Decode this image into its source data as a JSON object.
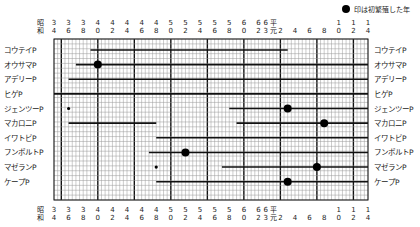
{
  "caption": "",
  "legend": {
    "marker": "●",
    "text": "印は初繁殖した年"
  },
  "axis": {
    "era_label_top": "昭",
    "era_label_bottom": "和",
    "ticks": [
      {
        "top": "3",
        "bottom": "4",
        "year": 1959
      },
      {
        "top": "3",
        "bottom": "6",
        "year": 1961
      },
      {
        "top": "3",
        "bottom": "8",
        "year": 1963
      },
      {
        "top": "4",
        "bottom": "0",
        "year": 1965
      },
      {
        "top": "4",
        "bottom": "2",
        "year": 1967
      },
      {
        "top": "4",
        "bottom": "4",
        "year": 1969
      },
      {
        "top": "4",
        "bottom": "6",
        "year": 1971
      },
      {
        "top": "4",
        "bottom": "8",
        "year": 1973
      },
      {
        "top": "5",
        "bottom": "0",
        "year": 1975
      },
      {
        "top": "5",
        "bottom": "2",
        "year": 1977
      },
      {
        "top": "5",
        "bottom": "4",
        "year": 1979
      },
      {
        "top": "5",
        "bottom": "6",
        "year": 1981
      },
      {
        "top": "5",
        "bottom": "8",
        "year": 1983
      },
      {
        "top": "6",
        "bottom": "0",
        "year": 1985
      },
      {
        "top": "6",
        "bottom": "2",
        "year": 1987
      },
      {
        "top": "6",
        "bottom": "3",
        "year": 1988
      },
      {
        "top": "平",
        "bottom": "元",
        "year": 1989
      },
      {
        "top": "",
        "bottom": "2",
        "year": 1990
      },
      {
        "top": "",
        "bottom": "4",
        "year": 1992
      },
      {
        "top": "",
        "bottom": "6",
        "year": 1994
      },
      {
        "top": "",
        "bottom": "8",
        "year": 1996
      },
      {
        "top": "1",
        "bottom": "0",
        "year": 1998
      },
      {
        "top": "1",
        "bottom": "2",
        "year": 2000
      },
      {
        "top": "1",
        "bottom": "4",
        "year": 2002
      }
    ]
  },
  "chart_data": {
    "type": "timeline",
    "title": "",
    "legend": [
      "● 印は初繁殖した年"
    ],
    "xlabel": "年（昭和34〜平成14）",
    "ylabel": "",
    "xlim": [
      1959,
      2002
    ],
    "grid": true,
    "categories": [
      "コウテイP",
      "オウサマP",
      "アデリーP",
      "ヒゲP",
      "ジェンツーP",
      "マカロニP",
      "イワトビP",
      "フンボルトP",
      "マゼランP",
      "ケープP"
    ],
    "series": [
      {
        "name": "コウテイP",
        "segments": [
          [
            1964,
            1991
          ]
        ],
        "first_breeding": null,
        "small_marks": []
      },
      {
        "name": "オウサマP",
        "segments": [
          [
            1962,
            2002
          ]
        ],
        "first_breeding": 1965,
        "small_marks": []
      },
      {
        "name": "アデリーP",
        "segments": [
          [
            1961,
            2002
          ]
        ],
        "first_breeding": null,
        "small_marks": []
      },
      {
        "name": "ヒゲP",
        "segments": [
          [
            1959,
            2002
          ]
        ],
        "first_breeding": null,
        "small_marks": []
      },
      {
        "name": "ジェンツーP",
        "segments": [
          [
            1983,
            2002
          ]
        ],
        "first_breeding": 1991,
        "small_marks": [
          1961
        ]
      },
      {
        "name": "マカロニP",
        "segments": [
          [
            1961,
            1973
          ],
          [
            1984,
            2002
          ]
        ],
        "first_breeding": 1996,
        "small_marks": []
      },
      {
        "name": "イワトビP",
        "segments": [
          [
            1973,
            2002
          ]
        ],
        "first_breeding": null,
        "small_marks": []
      },
      {
        "name": "フンボルトP",
        "segments": [
          [
            1972,
            2002
          ]
        ],
        "first_breeding": 1977,
        "small_marks": []
      },
      {
        "name": "マゼランP",
        "segments": [
          [
            1982,
            2002
          ]
        ],
        "first_breeding": 1995,
        "small_marks": [
          1973
        ]
      },
      {
        "name": "ケープP",
        "segments": [
          [
            1973,
            2002
          ]
        ],
        "first_breeding": 1991,
        "small_marks": []
      }
    ]
  }
}
